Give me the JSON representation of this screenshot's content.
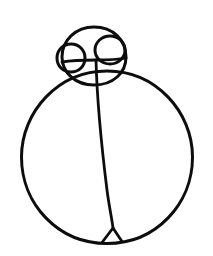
{
  "canvas": {
    "width": 213,
    "height": 256,
    "background_color": "#ffffff",
    "ink_color": "#0d0d0d",
    "title": "Hand-drawn sketch",
    "description": "A freehand black ink line drawing consisting of one large body circle, a smaller head circle overlapping its top, two small circles inside the head, a near-vertical dividing line through the body, and a small triangular notch where the line meets the bottom of the body circle."
  },
  "shapes": [
    {
      "id": "body-circle",
      "name": "body-circle",
      "kind": "circle",
      "label": "Large body circle",
      "center_x": 107,
      "center_y": 157,
      "radius_x": 86,
      "radius_y": 86,
      "stroke_color": "#0d0d0d",
      "stroke_width": 3.0,
      "path": "M 21.5 157 C 21.5 112 58 71 107 71 C 156 71 192.5 112 192.5 157 C 192.5 204 156 243.5 107 243.5 C 58 243.5 21.5 204 21.5 157 Z"
    },
    {
      "id": "head-circle",
      "name": "head-circle",
      "kind": "circle",
      "label": "Head circle",
      "center_x": 94,
      "center_y": 56,
      "radius_x": 32,
      "radius_y": 29,
      "stroke_color": "#0d0d0d",
      "stroke_width": 3.0,
      "path": "M 62 57 C 62 40 76 27 94 27 C 113 27 126 40 126 57 C 126 73 113 85 94 85 C 76 85 62 73 62 57 Z"
    },
    {
      "id": "left-small-circle",
      "name": "left-small-circle",
      "kind": "circle",
      "label": "Left small circle",
      "center_x": 71,
      "center_y": 58,
      "radius_x": 14,
      "radius_y": 14,
      "stroke_color": "#0d0d0d",
      "stroke_width": 3.0,
      "path": "M 57 58 C 57 50 63 44 71 44 C 79 44 85 50 85 58 C 85 66 79 72 71 72 C 63 72 57 66 57 58 Z"
    },
    {
      "id": "right-small-circle",
      "name": "right-small-circle",
      "kind": "circle",
      "label": "Right small circle",
      "center_x": 110,
      "center_y": 50,
      "radius_x": 15,
      "radius_y": 14,
      "stroke_color": "#0d0d0d",
      "stroke_width": 3.0,
      "path": "M 95 50 C 95 42 102 36 110 36 C 118 36 125 42 125 50 C 125 58 118 64 110 64 C 102 64 95 58 95 50 Z"
    },
    {
      "id": "divider-line",
      "name": "divider-line",
      "kind": "line",
      "label": "Vertical dividing line",
      "start_x": 96,
      "start_y": 60,
      "end_x": 113,
      "end_y": 228,
      "stroke_color": "#0d0d0d",
      "stroke_width": 2.8,
      "path": "M 96 60 C 97 100 102 150 107 190 C 109 206 112 219 113 228"
    },
    {
      "id": "bottom-notch",
      "name": "bottom-notch",
      "kind": "triangle",
      "label": "Small triangle notch at bottom",
      "stroke_color": "#0d0d0d",
      "stroke_width": 2.8,
      "path": "M 113 228 L 102 242.5 M 113 228 L 122 241.5"
    },
    {
      "id": "head-chin-line",
      "name": "head-chin-line",
      "kind": "line",
      "label": "Short chin line under head",
      "stroke_color": "#0d0d0d",
      "stroke_width": 2.8,
      "path": "M 62 62 C 74 60 86 60 96 60 C 106 60 116 60 126 58"
    }
  ],
  "stats": {
    "shape_count": 7,
    "circle_count": 4,
    "line_count": 3
  }
}
